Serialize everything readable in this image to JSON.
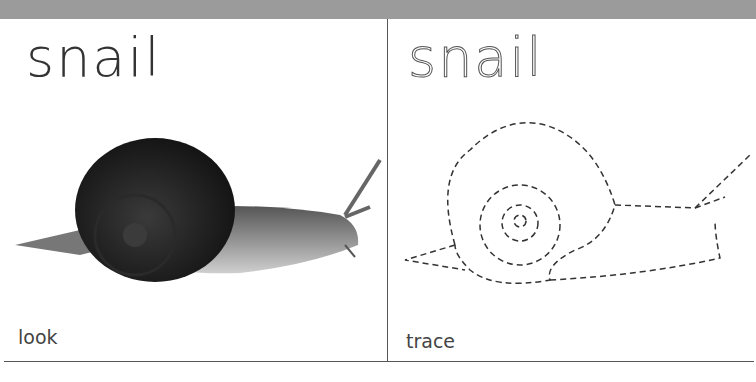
{
  "card": {
    "word": "snail",
    "left_panel": {
      "title": "snail",
      "caption": "look",
      "image": "snail-photo"
    },
    "right_panel": {
      "title": "snail",
      "caption": "trace",
      "image": "snail-dashed-outline"
    }
  },
  "colors": {
    "top_bar": "#9b9b9b",
    "text": "#333333",
    "lines": "#555555"
  }
}
